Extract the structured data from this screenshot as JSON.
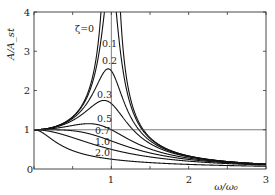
{
  "chart_data": {
    "type": "line",
    "title": "",
    "xlabel": "ω/ω₀",
    "ylabel": "A/A_st",
    "xlim": [
      0,
      3
    ],
    "ylim": [
      0,
      4
    ],
    "xticks": [
      0,
      1,
      2,
      3
    ],
    "yticks": [
      1,
      2,
      3,
      4
    ],
    "x_minor_ticks": [
      0.5,
      1.5,
      2.5
    ],
    "grid": false,
    "reference_lines": [
      {
        "orientation": "vertical",
        "value": 1
      },
      {
        "orientation": "horizontal",
        "value": 1
      }
    ],
    "formula": "A/A_st = 1 / sqrt((1 - r^2)^2 + (2*zeta*r)^2), r = ω/ω₀",
    "series": [
      {
        "name": "ζ=0",
        "zeta": 0,
        "peak": "infinite at r=1"
      },
      {
        "name": "0.1",
        "zeta": 0.1,
        "peak_y": 5.03,
        "peak_x": 0.99
      },
      {
        "name": "0.2",
        "zeta": 0.2,
        "peak_y": 2.55,
        "peak_x": 0.96
      },
      {
        "name": "0.3",
        "zeta": 0.3,
        "peak_y": 1.75,
        "peak_x": 0.91
      },
      {
        "name": "0.5",
        "zeta": 0.5,
        "peak_y": 1.15,
        "peak_x": 0.71
      },
      {
        "name": "0.7",
        "zeta": 0.7,
        "peak_y": 1.0,
        "peak_x": 0.14
      },
      {
        "name": "1.0",
        "zeta": 1.0,
        "peak_y": 1.0,
        "peak_x": 0
      },
      {
        "name": "2.0",
        "zeta": 2.0,
        "peak_y": 1.0,
        "peak_x": 0
      }
    ],
    "sample_values": {
      "x": [
        0,
        0.5,
        1.0,
        1.5,
        2.0,
        3.0
      ],
      "zeta_0.3": [
        1.0,
        1.25,
        1.67,
        0.7,
        0.31,
        0.12
      ],
      "zeta_0.5": [
        1.0,
        1.13,
        1.0,
        0.55,
        0.28,
        0.12
      ],
      "zeta_1.0": [
        1.0,
        0.8,
        0.5,
        0.31,
        0.2,
        0.1
      ],
      "zeta_2.0": [
        1.0,
        0.47,
        0.25,
        0.16,
        0.12,
        0.08
      ]
    }
  },
  "labels": {
    "x_axis": "ω/ω₀",
    "y_axis": "A/A_st",
    "x_ticks": [
      "0",
      "1",
      "2",
      "3"
    ],
    "y_ticks": [
      "1",
      "2",
      "3",
      "4"
    ],
    "curves": [
      "ζ=0",
      "0.1",
      "0.2",
      "0.3",
      "0.5",
      "0.7",
      "1.0",
      "2.0"
    ]
  }
}
